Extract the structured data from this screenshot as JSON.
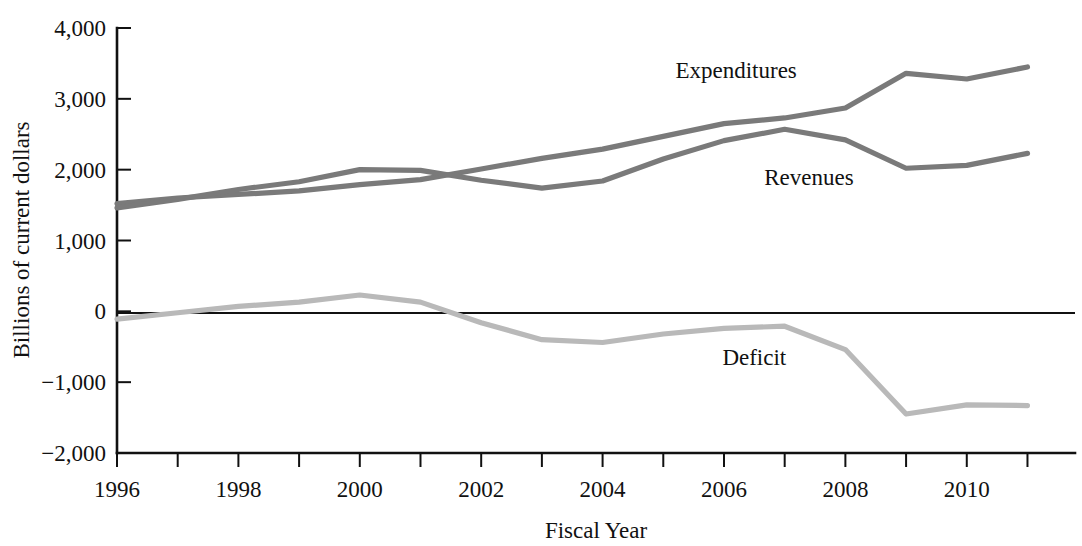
{
  "chart_data": {
    "type": "line",
    "title": "",
    "xlabel": "Fiscal Year",
    "ylabel": "Billions of current dollars",
    "xlim": [
      1996,
      2011.75
    ],
    "ylim": [
      -2000,
      4000
    ],
    "grid": false,
    "legend_position": "inline-annotations",
    "x": [
      1996,
      1997,
      1998,
      1999,
      2000,
      2001,
      2002,
      2003,
      2004,
      2005,
      2006,
      2007,
      2008,
      2009,
      2010,
      2011
    ],
    "xticks": [
      1996,
      1998,
      2000,
      2002,
      2004,
      2006,
      2008,
      2010
    ],
    "xtick_labels": [
      "1996",
      "1998",
      "2000",
      "2002",
      "2004",
      "2006",
      "2008",
      "2010"
    ],
    "yticks": [
      -2000,
      -1000,
      0,
      1000,
      2000,
      3000,
      4000
    ],
    "ytick_labels": [
      "−2,000",
      "−1,000",
      "0",
      "1,000",
      "2,000",
      "3,000",
      "4,000"
    ],
    "series": [
      {
        "name": "Expenditures",
        "color": "#7a7a7a",
        "label_x": 2006.2,
        "label_y": 3300,
        "values": [
          1520,
          1600,
          1650,
          1700,
          1790,
          1860,
          2010,
          2160,
          2290,
          2470,
          2650,
          2730,
          2870,
          3360,
          3280,
          3450
        ]
      },
      {
        "name": "Revenues",
        "color": "#7a7a7a",
        "label_x": 2007.4,
        "label_y": 1780,
        "values": [
          1460,
          1580,
          1720,
          1830,
          2000,
          1990,
          1850,
          1740,
          1840,
          2150,
          2410,
          2570,
          2420,
          2020,
          2060,
          2230
        ]
      },
      {
        "name": "Deficit",
        "color": "#b9b9b9",
        "label_x": 2006.5,
        "label_y": -760,
        "values": [
          -110,
          -20,
          70,
          130,
          230,
          130,
          -160,
          -400,
          -440,
          -320,
          -240,
          -210,
          -540,
          -1450,
          -1320,
          -1330
        ]
      }
    ]
  },
  "labels": {
    "ylabel": "Billions of current dollars",
    "xlabel": "Fiscal Year",
    "expenditures": "Expenditures",
    "revenues": "Revenues",
    "deficit": "Deficit"
  }
}
